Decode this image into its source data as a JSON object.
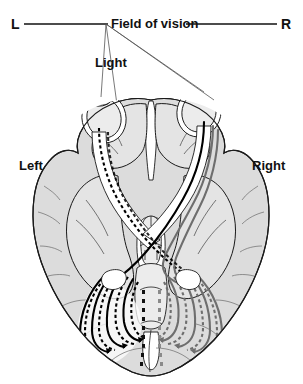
{
  "figure": {
    "type": "anatomical-diagram"
  },
  "labels": {
    "left_field_marker": "L",
    "right_field_marker": "R",
    "field_of_vision": "Field of vision",
    "light": "Light",
    "left_hemisphere": "Left",
    "right_hemisphere": "Right"
  },
  "colors": {
    "brain_fill": "#dcdcdc",
    "brain_fill_light": "#e8e8e8",
    "outline": "#1a1a1a",
    "tract_black": "#000000",
    "tract_gray": "#707070",
    "text": "#111111",
    "background": "#ffffff",
    "ray_line": "#555555",
    "frame": "#e0e0e0"
  },
  "structures": {
    "eyes": [
      "left-eye",
      "right-eye"
    ],
    "pathways": [
      {
        "name": "nasal-retinal-fibers-dashed",
        "style": "dashed",
        "color": "#000000"
      },
      {
        "name": "temporal-retinal-fibers-solid",
        "style": "solid",
        "color": "#000000"
      },
      {
        "name": "contralateral-fibers-gray",
        "style": "solid",
        "color": "#707070"
      },
      {
        "name": "optic-radiation-fan-left",
        "style": "mixed"
      },
      {
        "name": "optic-radiation-fan-right",
        "style": "mixed"
      }
    ],
    "midline": [
      "optic-chiasm",
      "midbrain",
      "brainstem",
      "cerebellum-vermis"
    ]
  }
}
